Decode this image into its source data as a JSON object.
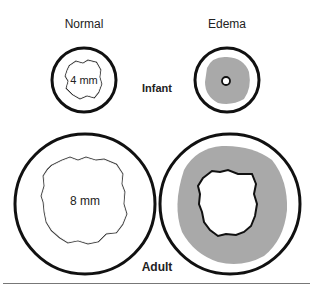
{
  "columns": {
    "normal": "Normal",
    "edema": "Edema"
  },
  "rows": {
    "infant": "Infant",
    "adult": "Adult"
  },
  "diameters": {
    "infant_normal": "4 mm",
    "adult_normal": "8 mm"
  },
  "colors": {
    "wall": "#111111",
    "edema_fill": "#a9a9a9",
    "lumen_outline": "#333333",
    "rule": "#777777"
  }
}
